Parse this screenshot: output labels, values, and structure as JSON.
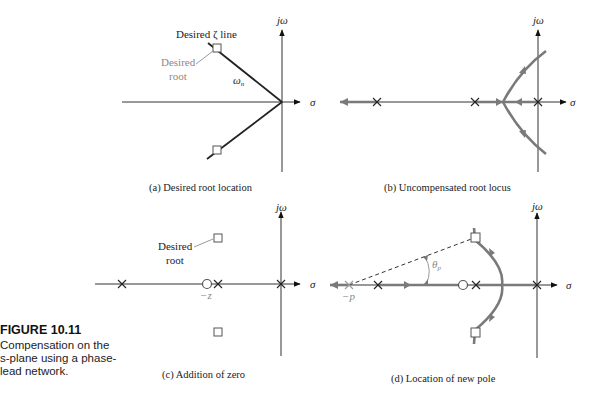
{
  "figure": {
    "number": "FIGURE 10.11",
    "caption": "Compensation on the s-plane using a phase-lead network."
  },
  "axes": {
    "imag_label": "jω",
    "real_label": "σ"
  },
  "panels": {
    "a": {
      "caption": "(a)  Desired root location",
      "zeta_line_label": "Desired ζ line",
      "desired_root_label_line1": "Desired",
      "desired_root_label_line2": "root",
      "wn_label": "ωn"
    },
    "b": {
      "caption": "(b)  Uncompensated root locus"
    },
    "c": {
      "caption": "(c)  Addition of zero",
      "desired_root_label_line1": "Desired",
      "desired_root_label_line2": "root",
      "zero_label": "−z"
    },
    "d": {
      "caption": "(d)  Location of new pole",
      "pole_label": "−p",
      "angle_label": "θp"
    }
  },
  "colors": {
    "axis": "#333333",
    "locus": "#7a7a7a",
    "annotation_gray": "#8a8a8a"
  }
}
